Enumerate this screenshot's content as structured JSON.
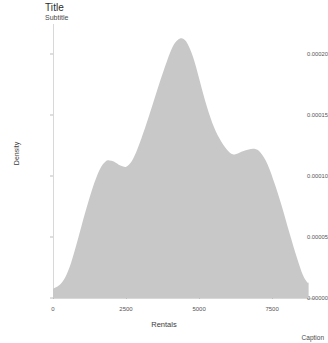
{
  "chart_data": {
    "type": "area",
    "title": "Title",
    "subtitle": "Subtitle",
    "caption": "Caption",
    "xlabel": "Rentals",
    "ylabel": "Density",
    "grid": false,
    "legend": false,
    "fill_color": "#c8c8c8",
    "xlim": [
      0,
      8900
    ],
    "ylim": [
      0,
      0.000225
    ],
    "xticks": [
      0,
      2500,
      5000,
      7500
    ],
    "xtick_labels": [
      "0",
      "2500",
      "5000",
      "7500"
    ],
    "yticks": [
      0.0,
      5e-05,
      0.0001,
      0.00015,
      0.0002
    ],
    "ytick_labels": [
      "0.00000",
      "0.00005",
      "0.00010",
      "0.00015",
      "0.00020"
    ],
    "series": [
      {
        "name": "Density",
        "x": [
          0,
          120,
          260,
          420,
          620,
          850,
          1100,
          1350,
          1600,
          1800,
          1930,
          2080,
          2250,
          2400,
          2520,
          2700,
          2900,
          3150,
          3400,
          3650,
          3900,
          4100,
          4280,
          4430,
          4600,
          4800,
          5000,
          5200,
          5450,
          5700,
          5950,
          6150,
          6300,
          6500,
          6700,
          6900,
          7100,
          7350,
          7600,
          7850,
          8100,
          8350,
          8550,
          8700,
          8750
        ],
        "y": [
          7.5e-06,
          9e-06,
          1.15e-05,
          1.7e-05,
          2.9e-05,
          4.8e-05,
          7e-05,
          9e-05,
          0.0001055,
          0.000112,
          0.000113,
          0.000112,
          0.0001095,
          0.000108,
          0.000108,
          0.0001125,
          0.000123,
          0.0001395,
          0.000158,
          0.000177,
          0.0001945,
          0.0002065,
          0.000212,
          0.000213,
          0.000209,
          0.0001975,
          0.0001805,
          0.0001625,
          0.000144,
          0.000131,
          0.000122,
          0.000118,
          0.0001185,
          0.0001205,
          0.000122,
          0.0001225,
          0.0001195,
          0.0001095,
          9.3e-05,
          7.4e-05,
          5.3e-05,
          3.3e-05,
          1.9e-05,
          1.3e-05,
          1.28e-05
        ]
      }
    ]
  }
}
